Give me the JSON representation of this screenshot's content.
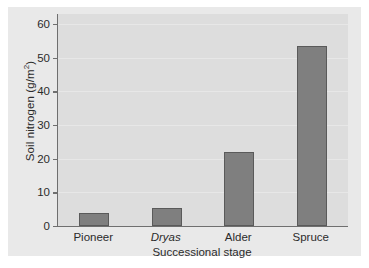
{
  "chart_data": {
    "type": "bar",
    "title": "",
    "categories": [
      "Pioneer",
      "Dryas",
      "Alder",
      "Spruce"
    ],
    "categories_italic": [
      false,
      true,
      false,
      false
    ],
    "values": [
      3.8,
      5.5,
      22,
      53.5
    ],
    "xlabel": "Successional stage",
    "ylabel_text": "Soil nitrogen (g/m",
    "ylabel_sup": "2",
    "ylabel_tail": ")",
    "ylabel_full": "Soil nitrogen (g/m2)",
    "ylim": [
      0,
      63
    ],
    "yticks": [
      0,
      10,
      20,
      30,
      40,
      50,
      60
    ],
    "ytick_labels": [
      "0",
      "10",
      "20",
      "30",
      "40",
      "50",
      "60"
    ],
    "grid": true,
    "legend": null,
    "colors": {
      "bar_fill": "#7f7f7f",
      "bar_border": "#5a5a5a",
      "plot_background": "#dddddd",
      "figure_background": "#e9e9e9",
      "axis": "#6f6f6f",
      "text": "#2b2b2b"
    }
  }
}
